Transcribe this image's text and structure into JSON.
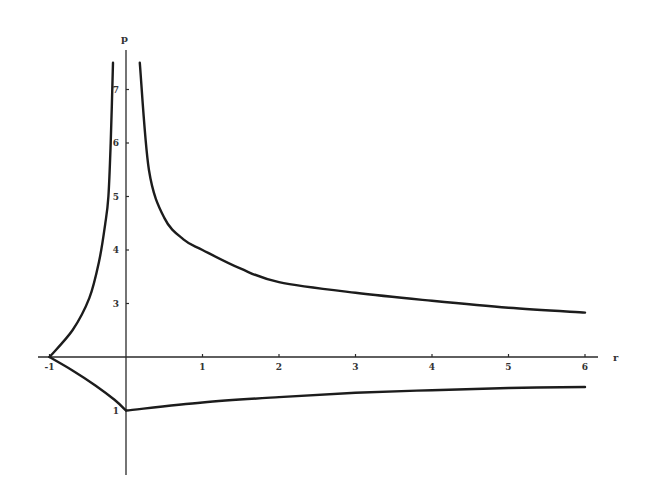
{
  "chart_data": {
    "type": "line",
    "title": "",
    "xlabel": "r",
    "ylabel": "p",
    "xlim": [
      -1.15,
      6.2
    ],
    "ylim": [
      -0.2,
      7.8
    ],
    "grid": false,
    "legend": null,
    "x_ticks": [
      -1,
      1,
      2,
      3,
      4,
      5,
      6
    ],
    "y_ticks": [
      1,
      3,
      4,
      5,
      6,
      7
    ],
    "x_tick_labels": [
      "-1",
      "1",
      "2",
      "3",
      "4",
      "5",
      "6"
    ],
    "y_tick_labels": [
      "1",
      "3",
      "4",
      "5",
      "6",
      "7"
    ],
    "axes_cross_at": {
      "x": 0,
      "y": 2
    },
    "series": [
      {
        "name": "upper-left branch",
        "points": [
          [
            -1,
            2
          ],
          [
            -0.7,
            2.5
          ],
          [
            -0.48,
            3.1
          ],
          [
            -0.35,
            3.8
          ],
          [
            -0.27,
            4.5
          ],
          [
            -0.23,
            5.0
          ],
          [
            -0.2,
            6.0
          ],
          [
            -0.17,
            7.5
          ]
        ]
      },
      {
        "name": "upper-right branch",
        "points": [
          [
            0.18,
            7.5
          ],
          [
            0.3,
            5.5
          ],
          [
            0.5,
            4.6
          ],
          [
            0.75,
            4.2
          ],
          [
            1,
            4.0
          ],
          [
            1.5,
            3.65
          ],
          [
            2,
            3.4
          ],
          [
            3,
            3.2
          ],
          [
            4,
            3.05
          ],
          [
            5,
            2.92
          ],
          [
            6,
            2.83
          ]
        ]
      },
      {
        "name": "lower-left branch",
        "points": [
          [
            -1,
            2
          ],
          [
            -0.7,
            1.75
          ],
          [
            -0.4,
            1.47
          ],
          [
            -0.15,
            1.2
          ],
          [
            0,
            1.0
          ]
        ]
      },
      {
        "name": "lower-right branch",
        "points": [
          [
            0,
            1.0
          ],
          [
            1,
            1.15
          ],
          [
            2,
            1.25
          ],
          [
            3,
            1.33
          ],
          [
            4,
            1.38
          ],
          [
            5,
            1.42
          ],
          [
            6,
            1.44
          ]
        ]
      }
    ]
  }
}
